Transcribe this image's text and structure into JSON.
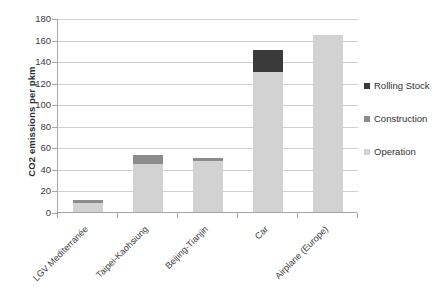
{
  "chart_data": {
    "type": "bar",
    "title": "",
    "subtitle": "",
    "xlabel": "",
    "ylabel": "CO2 emissions per pkm",
    "ylim": [
      0,
      180
    ],
    "ytick_step": 20,
    "yticks": [
      0,
      20,
      40,
      60,
      80,
      100,
      120,
      140,
      160,
      180
    ],
    "grid": true,
    "stacked": true,
    "legend_position": "right",
    "categories": [
      "LGV Mediterranée",
      "Taipei-Kaohsiung",
      "Beijing-Tianjin",
      "Car",
      "Airplane (Europe)"
    ],
    "series": [
      {
        "name": "Operation",
        "color": "#d2d2d2",
        "values": [
          8,
          45,
          47,
          130,
          164
        ]
      },
      {
        "name": "Construction",
        "color": "#8c8c8c",
        "values": [
          3,
          8,
          3,
          0,
          0
        ]
      },
      {
        "name": "Rolling Stock",
        "color": "#3a3a3a",
        "values": [
          0,
          0,
          0,
          20,
          0
        ]
      }
    ],
    "totals": [
      11,
      53,
      50,
      150,
      164
    ],
    "legend_order": [
      "Rolling Stock",
      "Construction",
      "Operation"
    ]
  },
  "legend": {
    "items": [
      {
        "label": "Rolling Stock",
        "color": "#3a3a3a"
      },
      {
        "label": "Construction",
        "color": "#8c8c8c"
      },
      {
        "label": "Operation",
        "color": "#d2d2d2"
      }
    ]
  }
}
